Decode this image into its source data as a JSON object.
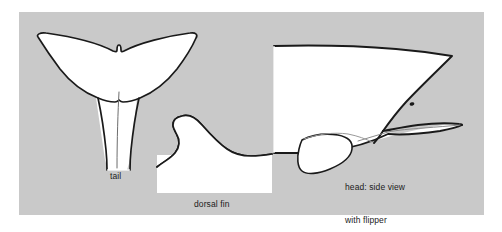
{
  "figure": {
    "kind": "anatomical-line-drawing",
    "background_color": "#ffffff",
    "panel_color": "#c9c9c9",
    "shape_fill": "#ffffff",
    "outline_color": "#1a1a1a",
    "label_color": "#1b1b1b"
  },
  "panel": {
    "x": 19,
    "y": 12,
    "width": 465,
    "height": 203
  },
  "labels": {
    "tail": "tail",
    "dorsal_fin": "dorsal fin",
    "head_line1": "head: side view",
    "head_line2": "with flipper"
  },
  "parts": [
    {
      "name": "tail",
      "label": "tail",
      "description": "whale tail flukes seen from behind with narrowing peduncle stalk"
    },
    {
      "name": "dorsal-fin",
      "label": "dorsal fin",
      "description": "hooked dorsal fin rising from a flat back section"
    },
    {
      "name": "head",
      "label": "head: side view with flipper",
      "description": "side view of the head showing eye, mouth line, melon and pectoral flipper"
    }
  ]
}
